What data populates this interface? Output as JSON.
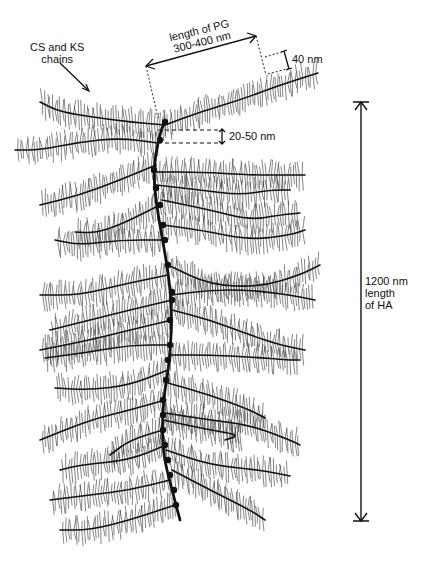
{
  "diagram": {
    "ink_color": "#111111",
    "background": "#ffffff",
    "labels": {
      "cs_ks": [
        "CS and KS",
        "chains"
      ],
      "pg_length": [
        "length of PG",
        "300-400 nm"
      ],
      "pg_width": "40 nm",
      "spacing": "20-50 nm",
      "ha_length": [
        "1200 nm",
        "length",
        "of HA"
      ]
    },
    "spine": [
      [
        165,
        120
      ],
      [
        158,
        140
      ],
      [
        153,
        175
      ],
      [
        158,
        215
      ],
      [
        168,
        270
      ],
      [
        172,
        310
      ],
      [
        170,
        360
      ],
      [
        163,
        400
      ],
      [
        162,
        450
      ],
      [
        172,
        490
      ],
      [
        180,
        520
      ]
    ],
    "branches": [
      {
        "from": [
          158,
          143
        ],
        "pts": [
          [
            120,
            138
          ],
          [
            80,
            142
          ],
          [
            40,
            150
          ],
          [
            15,
            150
          ]
        ]
      },
      {
        "from": [
          165,
          125
        ],
        "pts": [
          [
            130,
            122
          ],
          [
            100,
            118
          ],
          [
            60,
            112
          ],
          [
            40,
            102
          ]
        ]
      },
      {
        "from": [
          165,
          125
        ],
        "pts": [
          [
            200,
            112
          ],
          [
            240,
            100
          ],
          [
            280,
            85
          ],
          [
            318,
            73
          ]
        ]
      },
      {
        "from": [
          156,
          165
        ],
        "pts": [
          [
            120,
            180
          ],
          [
            80,
            195
          ],
          [
            40,
            205
          ]
        ]
      },
      {
        "from": [
          157,
          172
        ],
        "pts": [
          [
            200,
            172
          ],
          [
            250,
            175
          ],
          [
            285,
            175
          ],
          [
            305,
            175
          ]
        ]
      },
      {
        "from": [
          156,
          185
        ],
        "pts": [
          [
            200,
            190
          ],
          [
            240,
            195
          ],
          [
            270,
            190
          ],
          [
            290,
            190
          ]
        ]
      },
      {
        "from": [
          160,
          205
        ],
        "pts": [
          [
            120,
            225
          ],
          [
            95,
            233
          ],
          [
            75,
            232
          ]
        ]
      },
      {
        "from": [
          162,
          200
        ],
        "pts": [
          [
            210,
            210
          ],
          [
            250,
            220
          ],
          [
            280,
            215
          ],
          [
            300,
            213
          ]
        ]
      },
      {
        "from": [
          163,
          240
        ],
        "pts": [
          [
            120,
            240
          ],
          [
            80,
            245
          ],
          [
            55,
            240
          ]
        ]
      },
      {
        "from": [
          163,
          225
        ],
        "pts": [
          [
            200,
            230
          ],
          [
            250,
            240
          ],
          [
            290,
            235
          ],
          [
            305,
            230
          ]
        ]
      },
      {
        "from": [
          168,
          275
        ],
        "pts": [
          [
            120,
            285
          ],
          [
            80,
            295
          ],
          [
            40,
            295
          ]
        ]
      },
      {
        "from": [
          168,
          265
        ],
        "pts": [
          [
            210,
            285
          ],
          [
            260,
            287
          ],
          [
            300,
            275
          ],
          [
            320,
            265
          ]
        ]
      },
      {
        "from": [
          172,
          300
        ],
        "pts": [
          [
            130,
            310
          ],
          [
            90,
            320
          ],
          [
            50,
            330
          ]
        ]
      },
      {
        "from": [
          172,
          295
        ],
        "pts": [
          [
            210,
            290
          ],
          [
            250,
            290
          ],
          [
            290,
            295
          ],
          [
            315,
            300
          ]
        ]
      },
      {
        "from": [
          172,
          320
        ],
        "pts": [
          [
            130,
            330
          ],
          [
            90,
            340
          ],
          [
            40,
            350
          ]
        ]
      },
      {
        "from": [
          172,
          310
        ],
        "pts": [
          [
            210,
            320
          ],
          [
            250,
            335
          ],
          [
            280,
            345
          ],
          [
            305,
            350
          ]
        ]
      },
      {
        "from": [
          170,
          345
        ],
        "pts": [
          [
            130,
            345
          ],
          [
            90,
            352
          ],
          [
            45,
            358
          ]
        ]
      },
      {
        "from": [
          170,
          355
        ],
        "pts": [
          [
            210,
            355
          ],
          [
            250,
            357
          ],
          [
            290,
            360
          ],
          [
            300,
            360
          ]
        ]
      },
      {
        "from": [
          168,
          370
        ],
        "pts": [
          [
            130,
            385
          ],
          [
            90,
            390
          ],
          [
            55,
            388
          ]
        ]
      },
      {
        "from": [
          168,
          383
        ],
        "pts": [
          [
            210,
            395
          ],
          [
            250,
            410
          ],
          [
            265,
            418
          ]
        ]
      },
      {
        "from": [
          165,
          400
        ],
        "pts": [
          [
            130,
            410
          ],
          [
            90,
            420
          ],
          [
            40,
            440
          ]
        ]
      },
      {
        "from": [
          165,
          413
        ],
        "pts": [
          [
            210,
            420
          ],
          [
            250,
            425
          ],
          [
            290,
            440
          ],
          [
            300,
            445
          ]
        ]
      },
      {
        "from": [
          163,
          430
        ],
        "pts": [
          [
            130,
            440
          ],
          [
            110,
            455
          ]
        ]
      },
      {
        "from": [
          163,
          420
        ],
        "pts": [
          [
            210,
            430
          ],
          [
            240,
            435
          ],
          [
            225,
            440
          ]
        ]
      },
      {
        "from": [
          166,
          445
        ],
        "pts": [
          [
            130,
            460
          ],
          [
            80,
            465
          ],
          [
            60,
            470
          ]
        ]
      },
      {
        "from": [
          166,
          450
        ],
        "pts": [
          [
            210,
            465
          ],
          [
            260,
            470
          ],
          [
            290,
            476
          ]
        ]
      },
      {
        "from": [
          170,
          480
        ],
        "pts": [
          [
            130,
            490
          ],
          [
            90,
            495
          ],
          [
            50,
            500
          ]
        ]
      },
      {
        "from": [
          172,
          470
        ],
        "pts": [
          [
            210,
            490
          ],
          [
            250,
            510
          ],
          [
            265,
            520
          ]
        ]
      },
      {
        "from": [
          175,
          505
        ],
        "pts": [
          [
            130,
            520
          ],
          [
            90,
            530
          ],
          [
            60,
            530
          ]
        ]
      }
    ],
    "nodes": [
      [
        165,
        122
      ],
      [
        160,
        140
      ],
      [
        154,
        170
      ],
      [
        156,
        188
      ],
      [
        160,
        205
      ],
      [
        163,
        225
      ],
      [
        165,
        240
      ],
      [
        168,
        265
      ],
      [
        172,
        292
      ],
      [
        172,
        300
      ],
      [
        170,
        320
      ],
      [
        170,
        345
      ],
      [
        168,
        360
      ],
      [
        166,
        380
      ],
      [
        163,
        400
      ],
      [
        163,
        415
      ],
      [
        163,
        430
      ],
      [
        165,
        445
      ],
      [
        168,
        460
      ],
      [
        170,
        475
      ],
      [
        174,
        490
      ],
      [
        176,
        505
      ]
    ]
  }
}
